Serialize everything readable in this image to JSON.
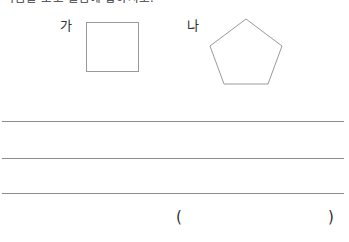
{
  "worksheet": {
    "prompt": "다음을 보고 물음에 답하시오.",
    "figures": [
      {
        "label": "가",
        "shape": "square"
      },
      {
        "label": "나",
        "shape": "pentagon"
      }
    ],
    "answer_lines": [
      "",
      "",
      ""
    ],
    "answer_field": {
      "open_paren": "(",
      "close_paren": ")",
      "value": ""
    }
  },
  "colors": {
    "page_background": "#ffffff",
    "text": "#303030",
    "shape_stroke": "#9a9a9a",
    "rule_line": "#8d8d8d"
  }
}
